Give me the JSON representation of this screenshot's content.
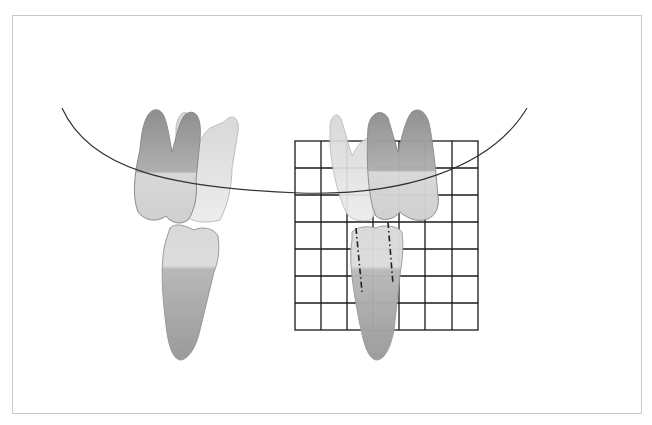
{
  "figure": {
    "type": "dental-illustration",
    "frame": {
      "border_color": "#c8c8c8",
      "background": "#ffffff"
    },
    "curve": {
      "color": "#333333",
      "label": "occlusal-curve"
    },
    "grid": {
      "columns": 7,
      "rows": 7,
      "line_color": "#1a1a1a",
      "x": 295,
      "y": 141,
      "width": 183,
      "height": 189
    },
    "left_group": {
      "label": "teeth-without-grid"
    },
    "right_group": {
      "label": "teeth-with-grid",
      "axis_lines": "dash-dot"
    },
    "colors": {
      "tooth_dark": "#9a9a9a",
      "tooth_mid": "#c4c4c4",
      "tooth_light": "#e2e2e2",
      "tooth_outline": "#8a8a8a"
    }
  }
}
